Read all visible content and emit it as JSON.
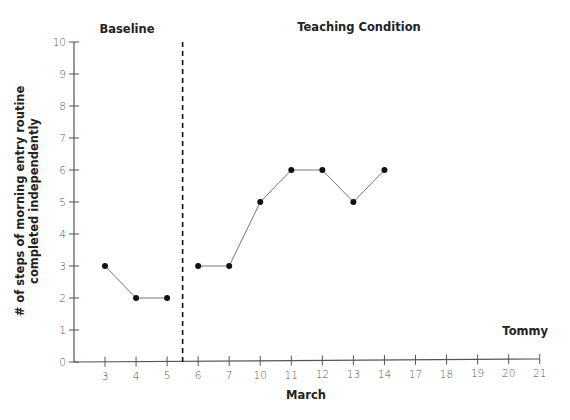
{
  "chart_data": {
    "type": "line",
    "title": "",
    "xlabel": "March",
    "ylabel": "# of steps of morning entry routine completed independently",
    "ylabel_lines": [
      "# of steps of morning entry routine",
      "completed independently"
    ],
    "ylim": [
      0,
      10
    ],
    "yticks": [
      0,
      1,
      2,
      3,
      4,
      5,
      6,
      7,
      8,
      9,
      10
    ],
    "categories": [
      "3",
      "4",
      "5",
      "6",
      "7",
      "10",
      "11",
      "12",
      "13",
      "14",
      "17",
      "18",
      "19",
      "20",
      "21"
    ],
    "grid": false,
    "phase_change_after": "5",
    "phases": [
      {
        "name": "Baseline",
        "x": [
          "3",
          "4",
          "5"
        ],
        "values": [
          3,
          2,
          2
        ]
      },
      {
        "name": "Teaching Condition",
        "x": [
          "6",
          "7",
          "10",
          "11",
          "12",
          "13",
          "14"
        ],
        "values": [
          3,
          3,
          5,
          6,
          6,
          5,
          6
        ]
      }
    ],
    "annotations": [
      "Tommy"
    ],
    "legend": null
  },
  "labels": {
    "baseline": "Baseline",
    "teaching": "Teaching Condition",
    "xlabel": "March",
    "ylabel_line1": "# of steps of morning entry routine",
    "ylabel_line2": "completed independently",
    "subject": "Tommy"
  },
  "colors": {
    "axis": "#555555",
    "line": "#777777",
    "marker": "#111111",
    "text": "#222222"
  }
}
